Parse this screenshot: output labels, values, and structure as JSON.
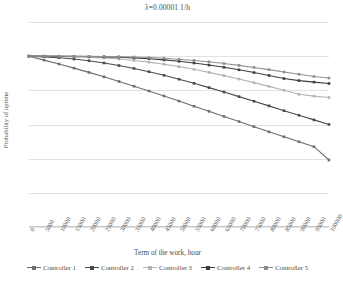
{
  "chart_data": {
    "type": "line",
    "title": "λ=0.00001 1/h",
    "xlabel": "Term of the work, hour",
    "ylabel": "Probability of uptime",
    "grid": true,
    "legend_position": "bottom",
    "xlim": [
      0,
      100000
    ],
    "ylim": [
      0,
      1.2
    ],
    "yticks": [
      "0",
      "0,2",
      "0,4",
      "0,6",
      "0,8",
      "1",
      "1,2"
    ],
    "ytick_values": [
      0,
      0.2,
      0.4,
      0.6,
      0.8,
      1.0,
      1.2
    ],
    "categories": [
      "0",
      "5000",
      "10000",
      "15000",
      "20000",
      "25000",
      "30000",
      "35000",
      "40000",
      "45000",
      "50000",
      "55000",
      "60000",
      "65000",
      "70000",
      "75000",
      "80000",
      "85000",
      "90000",
      "95000",
      "100000"
    ],
    "x": [
      0,
      5000,
      10000,
      15000,
      20000,
      25000,
      30000,
      35000,
      40000,
      45000,
      50000,
      55000,
      60000,
      65000,
      70000,
      75000,
      80000,
      85000,
      90000,
      95000,
      100000
    ],
    "series": [
      {
        "name": "Controller 1",
        "color": "#6e6e6e",
        "values": [
          1.0,
          0.977,
          0.954,
          0.93,
          0.905,
          0.879,
          0.852,
          0.824,
          0.796,
          0.767,
          0.737,
          0.707,
          0.677,
          0.647,
          0.617,
          0.587,
          0.557,
          0.528,
          0.499,
          0.47,
          0.392
        ]
      },
      {
        "name": "Controller 2",
        "color": "#4a4a4a",
        "values": [
          1.0,
          0.996,
          0.991,
          0.983,
          0.973,
          0.96,
          0.945,
          0.928,
          0.909,
          0.888,
          0.865,
          0.841,
          0.816,
          0.79,
          0.763,
          0.736,
          0.709,
          0.681,
          0.654,
          0.627,
          0.6
        ]
      },
      {
        "name": "Controller 3",
        "color": "#b4b4b4",
        "values": [
          1.0,
          0.999,
          0.998,
          0.996,
          0.993,
          0.989,
          0.983,
          0.975,
          0.965,
          0.953,
          0.939,
          0.923,
          0.905,
          0.886,
          0.866,
          0.845,
          0.823,
          0.8,
          0.777,
          0.766,
          0.758
        ]
      },
      {
        "name": "Controller 4",
        "color": "#3d3d3d",
        "values": [
          1.0,
          1.0,
          0.999,
          0.999,
          0.998,
          0.996,
          0.994,
          0.99,
          0.985,
          0.978,
          0.97,
          0.96,
          0.948,
          0.935,
          0.92,
          0.904,
          0.887,
          0.869,
          0.857,
          0.848,
          0.84
        ]
      },
      {
        "name": "Controller 5",
        "color": "#8f8f8f",
        "values": [
          1.0,
          1.0,
          1.0,
          0.999,
          0.999,
          0.998,
          0.997,
          0.995,
          0.992,
          0.988,
          0.982,
          0.975,
          0.967,
          0.957,
          0.946,
          0.934,
          0.921,
          0.907,
          0.894,
          0.881,
          0.872
        ]
      }
    ]
  }
}
